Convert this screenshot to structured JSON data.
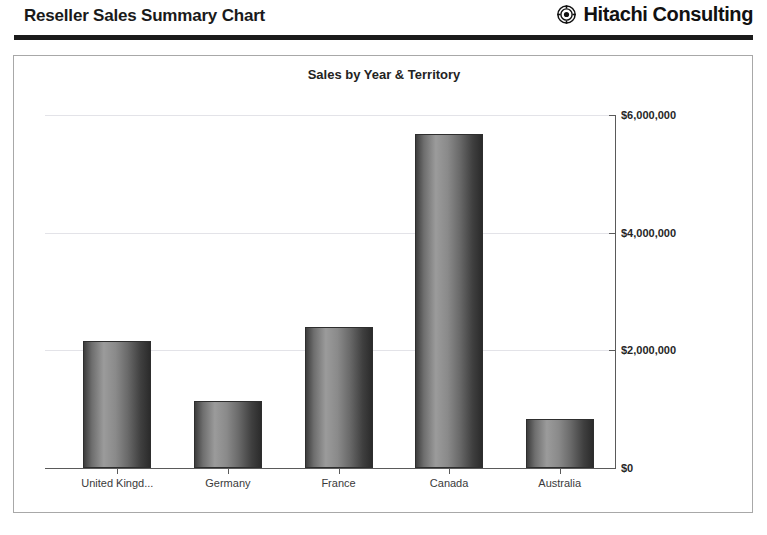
{
  "header": {
    "report_title": "Reseller Sales Summary Chart",
    "brand_name": "Hitachi Consulting",
    "brand_mark_icon": "hitachi-target-logo-icon",
    "rule_color": "#1b1b1b"
  },
  "panel": {
    "border_color": "#a8a8a8",
    "background": "#ffffff"
  },
  "chart_data": {
    "type": "bar",
    "title": "Sales by Year & Territory",
    "xlabel": "",
    "ylabel": "",
    "categories": [
      "United Kingd...",
      "Germany",
      "France",
      "Canada",
      "Australia"
    ],
    "values": [
      2160000,
      1140000,
      2400000,
      5670000,
      830000
    ],
    "ylim": [
      0,
      6000000
    ],
    "ytick_values": [
      0,
      2000000,
      4000000,
      6000000
    ],
    "ytick_labels": [
      "$0",
      "$2,000,000",
      "$4,000,000",
      "$6,000,000"
    ],
    "grid": true,
    "grid_color": "#e3e3e8",
    "legend": false,
    "bar_style": "cylinder",
    "bar_color_dark": "#2e2e2e",
    "bar_color_light": "#9b9b9b",
    "axis_color": "#5a5a5a"
  }
}
